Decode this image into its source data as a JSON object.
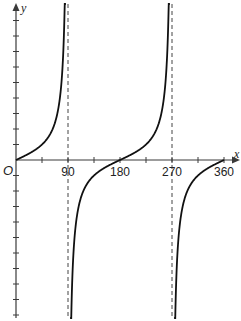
{
  "chart_data": {
    "type": "line",
    "title": "",
    "function": "y = tan x",
    "xlabel": "x",
    "ylabel": "y",
    "origin_label": "O",
    "x_tick_labels": [
      "90",
      "180",
      "270",
      "360"
    ],
    "x_ticks": [
      45,
      90,
      135,
      180,
      225,
      270,
      315,
      360
    ],
    "xlim": [
      0,
      370
    ],
    "ylim": [
      -10,
      10
    ],
    "y_tick_step": 1,
    "grid": false,
    "asymptotes": [
      90,
      270
    ],
    "series": [
      {
        "name": "tan x (branch 1)",
        "x": [
          0,
          20,
          45,
          60,
          70,
          80,
          84,
          86
        ],
        "y": [
          0,
          0.36,
          1,
          1.73,
          2.75,
          5.67,
          9.51,
          14.3
        ]
      },
      {
        "name": "tan x (branch 2)",
        "x": [
          94,
          96,
          100,
          110,
          120,
          135,
          160,
          180,
          200,
          225,
          240,
          250,
          260,
          264,
          266
        ],
        "y": [
          -14.3,
          -9.51,
          -5.67,
          -2.75,
          -1.73,
          -1,
          -0.36,
          0,
          0.36,
          1,
          1.73,
          2.75,
          5.67,
          9.51,
          14.3
        ]
      },
      {
        "name": "tan x (branch 3)",
        "x": [
          274,
          276,
          280,
          290,
          300,
          315,
          340,
          360
        ],
        "y": [
          -14.3,
          -9.51,
          -5.67,
          -2.75,
          -1.73,
          -1,
          -0.36,
          0
        ]
      }
    ],
    "legend": null
  }
}
